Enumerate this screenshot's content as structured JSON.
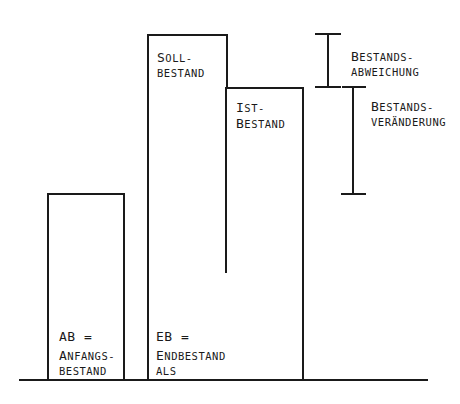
{
  "diagram": {
    "colors": {
      "stroke": "#1a1a1a",
      "background": "#ffffff"
    },
    "bars": [
      {
        "id": "ab",
        "label_line1": "AB =",
        "label_line2_cap": "A",
        "label_line2_rest": "NFANGS-",
        "label_line3": "BESTAND"
      },
      {
        "id": "soll",
        "label_line1_cap": "S",
        "label_line1_rest": "OLL-",
        "label_line2": "BESTAND"
      },
      {
        "id": "ist",
        "label_line1_cap": "I",
        "label_line1_rest": "ST-",
        "label_line2_cap": "B",
        "label_line2_rest": "ESTAND"
      },
      {
        "id": "eb",
        "label_line1": "EB =",
        "label_line2_cap": "E",
        "label_line2_rest": "NDBESTAND",
        "label_line3": "ALS"
      }
    ],
    "brackets": [
      {
        "id": "abweichung",
        "line1_cap": "B",
        "line1_rest": "ESTANDS-",
        "line2": "ABWEICHUNG"
      },
      {
        "id": "veraenderung",
        "line1_cap": "B",
        "line1_rest": "ESTANDS-",
        "line2": "VERÄNDERUNG"
      }
    ]
  }
}
